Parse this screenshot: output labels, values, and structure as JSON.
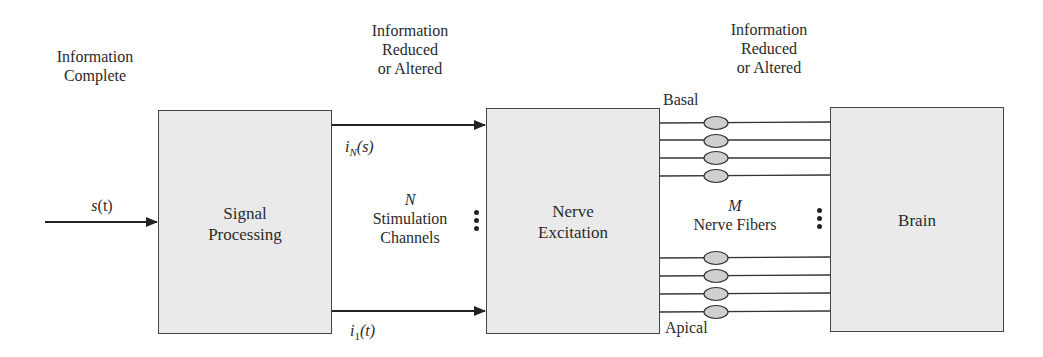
{
  "diagram": {
    "stages": [
      {
        "id": "signal-processing",
        "label_lines": [
          "Signal",
          "Processing"
        ]
      },
      {
        "id": "nerve-excitation",
        "label_lines": [
          "Nerve",
          "Excitation"
        ]
      },
      {
        "id": "brain",
        "label_lines": [
          "Brain"
        ]
      }
    ],
    "annotations": {
      "info_complete": [
        "Information",
        "Complete"
      ],
      "info_reduced_1": [
        "Information",
        "Reduced",
        "or Altered"
      ],
      "info_reduced_2": [
        "Information",
        "Reduced",
        "or Altered"
      ]
    },
    "signals": {
      "input": {
        "var": "s",
        "arg": "(t)"
      },
      "top_channel": {
        "var": "i",
        "sub": "N",
        "arg": "(s)"
      },
      "bottom_channel": {
        "var": "i",
        "sub": "1",
        "arg": "(t)"
      }
    },
    "channels": {
      "count_symbol": "N",
      "label_lines": [
        "Stimulation",
        "Channels"
      ]
    },
    "fibers": {
      "count_symbol": "M",
      "label": "Nerve Fibers",
      "top_end": "Basal",
      "bottom_end": "Apical",
      "top_group_count": 4,
      "bottom_group_count": 4
    },
    "colors": {
      "box_fill": "#eaeaea",
      "ellipse_fill": "#cfcfcf",
      "stroke": "#333333"
    }
  }
}
